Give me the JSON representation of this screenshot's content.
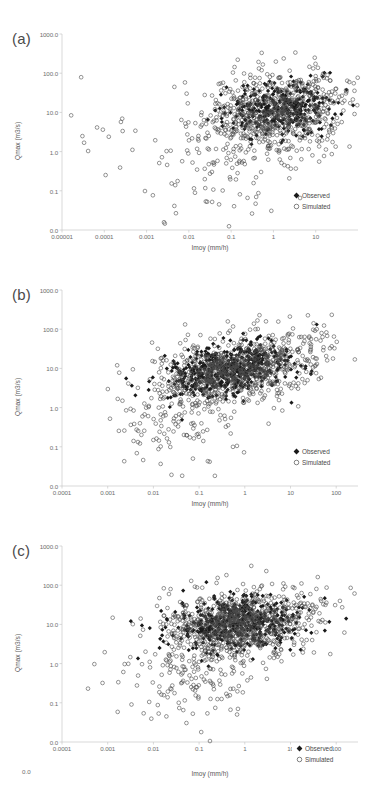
{
  "figure": {
    "type": "multi-panel-scatter",
    "panels": 3,
    "shared_xlabel": "Imoy (mm/h)",
    "shared_ylabel": "Qmax (m3/s)",
    "legend_entries": [
      {
        "label": "Observed",
        "marker": "filled-diamond",
        "color": "#1a1a1a"
      },
      {
        "label": "Simulated",
        "marker": "open-circle",
        "color": "#4d4d4d"
      }
    ]
  },
  "chart_data": [
    {
      "type": "scatter",
      "panel": "a",
      "panel_label": "(a)",
      "title": "",
      "xlabel": "Imoy (mm/h)",
      "ylabel": "Qmax (m3/s)",
      "xscale": "log",
      "yscale": "log",
      "xticks": [
        "0.00001",
        "0.0001",
        "0.001",
        "0.01",
        "0.1",
        "1",
        "10"
      ],
      "xtick_values": [
        1e-05,
        0.0001,
        0.001,
        0.01,
        0.1,
        1,
        10
      ],
      "yticks": [
        "1000.0",
        "100.0",
        "10.0",
        "1.0",
        "0.1",
        "0.0"
      ],
      "ytick_values": [
        1000,
        100,
        10,
        1,
        0.1,
        0.01
      ],
      "xlim": [
        1e-05,
        100
      ],
      "ylim": [
        0.01,
        1000
      ],
      "grid": false,
      "legend_position": "bottom-right-inside",
      "series": [
        {
          "name": "Observed",
          "marker": "filled-diamond",
          "color": "#1a1a1a",
          "n_points": 330,
          "x_center_log": 0.15,
          "x_spread_log": 0.62,
          "y_center_log": 1.12,
          "y_spread_log": 0.34,
          "correlation": 0.2,
          "seed": 101
        },
        {
          "name": "Simulated",
          "marker": "open-circle",
          "color": "#4d4d4d",
          "n_points": 700,
          "x_center_log": 0.0,
          "x_spread_log": 0.85,
          "y_center_log": 1.0,
          "y_spread_log": 0.55,
          "correlation": 0.2,
          "seed": 202
        },
        {
          "name": "Simulated-lowtail",
          "marker": "open-circle",
          "color": "#4d4d4d",
          "n_points": 95,
          "x_center_log": -1.4,
          "x_spread_log": 1.0,
          "y_center_log": -0.35,
          "y_spread_log": 0.75,
          "correlation": 0.1,
          "seed": 303
        },
        {
          "name": "Simulated-outliers",
          "marker": "open-circle",
          "color": "#4d4d4d",
          "n_points": 14,
          "x_center_log": -4.0,
          "x_spread_log": 0.55,
          "y_center_log": 0.55,
          "y_spread_log": 0.55,
          "correlation": 0.0,
          "seed": 404
        }
      ]
    },
    {
      "type": "scatter",
      "panel": "b",
      "panel_label": "(b)",
      "title": "",
      "xlabel": "Imoy (mm/h)",
      "ylabel": "Qmax (m3/s)",
      "xscale": "log",
      "yscale": "log",
      "xticks": [
        "0.0001",
        "0.001",
        "0.01",
        "0.1",
        "1",
        "10",
        "100"
      ],
      "xtick_values": [
        0.0001,
        0.001,
        0.01,
        0.1,
        1,
        10,
        100
      ],
      "yticks": [
        "1000.0",
        "100.0",
        "10.0",
        "1.0",
        "0.1",
        "0.0"
      ],
      "ytick_values": [
        1000,
        100,
        10,
        1,
        0.1,
        0.01
      ],
      "xlim": [
        0.0001,
        300
      ],
      "ylim": [
        0.01,
        1000
      ],
      "grid": false,
      "legend_position": "bottom-right-inside",
      "series": [
        {
          "name": "Observed",
          "marker": "filled-diamond",
          "color": "#1a1a1a",
          "n_points": 520,
          "x_center_log": -0.35,
          "x_spread_log": 0.72,
          "y_center_log": 0.95,
          "y_spread_log": 0.33,
          "correlation": 0.35,
          "seed": 111
        },
        {
          "name": "Simulated",
          "marker": "open-circle",
          "color": "#4d4d4d",
          "n_points": 760,
          "x_center_log": -0.3,
          "x_spread_log": 0.85,
          "y_center_log": 0.95,
          "y_spread_log": 0.45,
          "correlation": 0.35,
          "seed": 222
        },
        {
          "name": "Simulated-lowtail",
          "marker": "open-circle",
          "color": "#4d4d4d",
          "n_points": 115,
          "x_center_log": -1.3,
          "x_spread_log": 0.85,
          "y_center_log": -0.25,
          "y_spread_log": 0.55,
          "correlation": 0.15,
          "seed": 333
        },
        {
          "name": "Simulated-uppertail",
          "marker": "open-circle",
          "color": "#4d4d4d",
          "n_points": 40,
          "x_center_log": 1.3,
          "x_spread_log": 0.55,
          "y_center_log": 1.5,
          "y_spread_log": 0.35,
          "correlation": 0.4,
          "seed": 444
        }
      ]
    },
    {
      "type": "scatter",
      "panel": "c",
      "panel_label": "(c)",
      "title": "",
      "xlabel": "Imoy (mm/h)",
      "ylabel": "Qmax (m3/s)",
      "xscale": "log",
      "yscale": "log",
      "xticks": [
        "0.0001",
        "0.001",
        "0.01",
        "0.1",
        "1",
        "10",
        "100"
      ],
      "xtick_values": [
        0.0001,
        0.001,
        0.01,
        0.1,
        1,
        10,
        100
      ],
      "yticks": [
        "1000.0",
        "100.0",
        "10.0",
        "1.0",
        "0.1",
        "0.0"
      ],
      "ytick_values": [
        1000,
        100,
        10,
        1,
        0.1,
        0.01
      ],
      "extra_label": "0.0",
      "xlim": [
        0.0001,
        300
      ],
      "ylim": [
        0.01,
        1000
      ],
      "grid": false,
      "legend_position": "bottom-right-overlapping-axis",
      "series": [
        {
          "name": "Observed",
          "marker": "filled-diamond",
          "color": "#1a1a1a",
          "n_points": 470,
          "x_center_log": -0.15,
          "x_spread_log": 0.72,
          "y_center_log": 1.05,
          "y_spread_log": 0.32,
          "correlation": 0.15,
          "seed": 121
        },
        {
          "name": "Simulated",
          "marker": "open-circle",
          "color": "#4d4d4d",
          "n_points": 780,
          "x_center_log": -0.15,
          "x_spread_log": 0.82,
          "y_center_log": 1.0,
          "y_spread_log": 0.45,
          "correlation": 0.15,
          "seed": 232
        },
        {
          "name": "Simulated-lowtail",
          "marker": "open-circle",
          "color": "#4d4d4d",
          "n_points": 150,
          "x_center_log": -1.0,
          "x_spread_log": 0.8,
          "y_center_log": -0.35,
          "y_spread_log": 0.55,
          "correlation": 0.1,
          "seed": 343
        },
        {
          "name": "Simulated-uppertail",
          "marker": "open-circle",
          "color": "#4d4d4d",
          "n_points": 35,
          "x_center_log": 1.35,
          "x_spread_log": 0.5,
          "y_center_log": 1.35,
          "y_spread_log": 0.35,
          "correlation": 0.3,
          "seed": 454
        }
      ]
    }
  ],
  "layout": {
    "panel_tops": [
      12,
      268,
      524
    ],
    "plot_box": {
      "left": 62,
      "top": 22,
      "width": 296,
      "height": 196
    },
    "panel_label_pos": {
      "left": 12,
      "top": 18
    }
  }
}
